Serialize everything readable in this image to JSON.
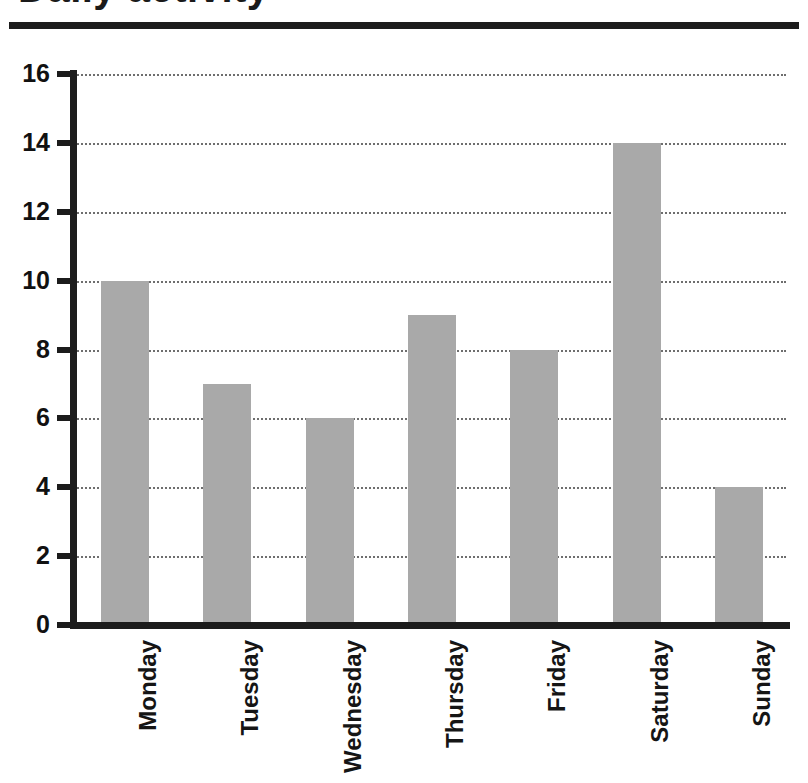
{
  "page": {
    "title_partial": "Daily activity"
  },
  "chart_data": {
    "type": "bar",
    "title": "",
    "xlabel": "",
    "ylabel": "",
    "categories": [
      "Monday",
      "Tuesday",
      "Wednesday",
      "Thursday",
      "Friday",
      "Saturday",
      "Sunday"
    ],
    "values": [
      10,
      7,
      6,
      9,
      8,
      14,
      4
    ],
    "ylim": [
      0,
      16
    ],
    "ytick_labels": [
      "0",
      "2",
      "4",
      "6",
      "8",
      "10",
      "12",
      "14",
      "16"
    ],
    "ytick_values": [
      0,
      2,
      4,
      6,
      8,
      10,
      12,
      14,
      16
    ],
    "grid": "horizontal-dotted",
    "legend": "none",
    "bar_color": "#a9a9a9",
    "axis_color": "#1c1c1c",
    "grid_color": "#6e6e6e",
    "xtick_label_rotation": "-90"
  }
}
